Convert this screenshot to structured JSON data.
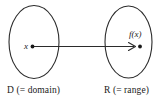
{
  "figure": {
    "type": "function-mapping-diagram",
    "background_color": "#ffffff",
    "stroke_color": "#2b2b2b",
    "labels": {
      "domain_caption": "D (= domain)",
      "range_caption": "R (= range)",
      "input_element": "x",
      "output_element": "f(x)"
    },
    "elements": {
      "domain_ellipse_name": "domain-ellipse",
      "range_ellipse_name": "range-ellipse",
      "arrow_name": "mapping-arrow",
      "input_dot_name": "input-point-dot",
      "output_dot_name": "output-point-dot"
    }
  }
}
